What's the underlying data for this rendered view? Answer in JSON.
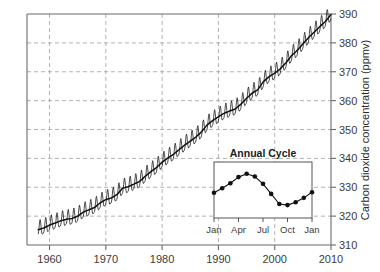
{
  "chart_data": {
    "type": "line",
    "title": "",
    "xlabel": "",
    "ylabel": "Carbon dioxide concentration (ppmv)",
    "xlim": [
      1956,
      2010
    ],
    "ylim": [
      310,
      390
    ],
    "xticks": [
      1960,
      1970,
      1980,
      1990,
      2000,
      2010
    ],
    "xticklabels": [
      "1960",
      "1970",
      "1980",
      "1990",
      "2000",
      "2010"
    ],
    "yticks": [
      310,
      320,
      330,
      340,
      350,
      360,
      370,
      380,
      390
    ],
    "yticklabels": [
      "310",
      "320",
      "330",
      "340",
      "350",
      "360",
      "370",
      "380",
      "390"
    ],
    "grid": true,
    "grid_style": "dashed",
    "grid_color": "#a9a9a9",
    "line_color": "#111111",
    "series": [
      {
        "name": "Monthly mean CO2 (Mauna Loa)",
        "description": "Keeling curve: rising annual-mean CO2 with superimposed sawtooth seasonal oscillation of roughly 6 ppmv peak-to-peak",
        "x": [
          1958,
          1959,
          1960,
          1961,
          1962,
          1963,
          1964,
          1965,
          1966,
          1967,
          1968,
          1969,
          1970,
          1971,
          1972,
          1973,
          1974,
          1975,
          1976,
          1977,
          1978,
          1979,
          1980,
          1981,
          1982,
          1983,
          1984,
          1985,
          1986,
          1987,
          1988,
          1989,
          1990,
          1991,
          1992,
          1993,
          1994,
          1995,
          1996,
          1997,
          1998,
          1999,
          2000,
          2001,
          2002,
          2003,
          2004,
          2005,
          2006,
          2007,
          2008,
          2009,
          2010
        ],
        "y": [
          315.3,
          315.9,
          316.9,
          317.6,
          318.4,
          318.9,
          319.2,
          320.0,
          321.4,
          322.2,
          323.0,
          324.6,
          325.7,
          326.3,
          327.5,
          329.7,
          330.2,
          331.1,
          332.0,
          333.8,
          335.4,
          336.8,
          338.7,
          340.1,
          341.4,
          343.0,
          344.6,
          346.0,
          347.4,
          349.2,
          351.6,
          353.1,
          354.4,
          355.6,
          356.4,
          357.1,
          358.8,
          360.8,
          362.6,
          363.8,
          366.6,
          368.3,
          369.5,
          371.0,
          373.1,
          375.6,
          377.4,
          379.6,
          381.8,
          383.7,
          385.6,
          387.4,
          389.8
        ],
        "seasonal_amplitude_ppmv": 6.0,
        "seasonal_peak_month": "May",
        "seasonal_trough_month": "September"
      }
    ]
  },
  "inset": {
    "title": "Annual Cycle",
    "type": "line",
    "xticklabels": [
      "Jan",
      "Apr",
      "Jul",
      "Oct",
      "Jan"
    ],
    "xtick_positions": [
      0,
      3,
      6,
      9,
      12
    ],
    "months": [
      "Jan",
      "Feb",
      "Mar",
      "Apr",
      "May",
      "Jun",
      "Jul",
      "Aug",
      "Sep",
      "Oct",
      "Nov",
      "Dec",
      "Jan"
    ],
    "values": [
      326.5,
      327.3,
      328.2,
      329.3,
      329.9,
      329.4,
      328.1,
      326.3,
      324.5,
      324.3,
      324.8,
      325.6,
      326.6
    ],
    "ylim": [
      322,
      332
    ],
    "marker": "filled-circle",
    "line_color": "#111111",
    "box_color": "#555555"
  },
  "axis": {
    "ylabel": "Carbon dioxide concentration (ppmv)",
    "frame_color": "#6b6b6b"
  }
}
